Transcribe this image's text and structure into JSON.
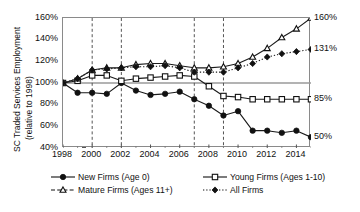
{
  "chart_data": {
    "type": "line",
    "title": "",
    "xlabel": "",
    "ylabel": "SC Traded Services Employment (relative to 1998)",
    "ylabel_line1": "SC Traded Services Employment",
    "ylabel_line2": "(relative to 1998)",
    "x": [
      1998,
      1999,
      2000,
      2001,
      2002,
      2003,
      2004,
      2005,
      2006,
      2007,
      2008,
      2009,
      2010,
      2011,
      2012,
      2013,
      2014,
      2015
    ],
    "xlim": [
      1998,
      2015
    ],
    "ylim": [
      40,
      160
    ],
    "yticks": [
      40,
      60,
      80,
      100,
      120,
      140,
      160
    ],
    "ytick_labels": [
      "40%",
      "60%",
      "80%",
      "100%",
      "120%",
      "140%",
      "160%"
    ],
    "xticks": [
      1998,
      2000,
      2002,
      2004,
      2006,
      2008,
      2010,
      2012,
      2014
    ],
    "xtick_labels": [
      "1998",
      "2000",
      "2002",
      "2004",
      "2006",
      "2008",
      "2010",
      "2012",
      "2014"
    ],
    "xtick_minor": [
      1999,
      2001,
      2003,
      2005,
      2007,
      2009,
      2011,
      2013,
      2015
    ],
    "grid": false,
    "reference_line": 100,
    "recession_lines": [
      2000,
      2002,
      2007,
      2009
    ],
    "legend_position": "below",
    "series": [
      {
        "name": "New Firms (Age 0)",
        "marker": "filled-circle",
        "line_style": "solid",
        "color": "#1a1a1a",
        "values": [
          100,
          91,
          91,
          90,
          100,
          93,
          89,
          90,
          92,
          85,
          79,
          70,
          74,
          56,
          56,
          54,
          56,
          50
        ],
        "end_label": "50%"
      },
      {
        "name": "Young Firms (Ages 1-10)",
        "marker": "open-square",
        "line_style": "solid",
        "color": "#1a1a1a",
        "values": [
          100,
          102,
          107,
          107,
          102,
          104,
          105,
          106,
          107,
          106,
          97,
          88,
          87,
          85,
          85,
          85,
          85,
          85
        ],
        "end_label": "85%"
      },
      {
        "name": "Mature Firms (Ages 11+)",
        "marker": "open-triangle",
        "line_style": "solid",
        "color": "#1a1a1a",
        "values": [
          100,
          104,
          112,
          114,
          114,
          117,
          118,
          118,
          116,
          114,
          114,
          115,
          118,
          124,
          132,
          142,
          150,
          160
        ],
        "end_label": "160%"
      },
      {
        "name": "All Firms",
        "marker": "filled-diamond",
        "line_style": "dotted",
        "color": "#1a1a1a",
        "values": [
          100,
          104,
          112,
          113,
          114,
          115,
          115,
          116,
          114,
          110,
          110,
          110,
          114,
          118,
          124,
          127,
          129,
          131
        ],
        "end_label": "131%"
      }
    ],
    "end_labels": [
      {
        "text": "160%",
        "value": 160
      },
      {
        "text": "131%",
        "value": 131
      },
      {
        "text": "85%",
        "value": 85
      },
      {
        "text": "50%",
        "value": 50
      }
    ]
  },
  "legend": {
    "items": [
      {
        "label": "New Firms (Age 0)",
        "marker": "filled-circle",
        "style": "solid"
      },
      {
        "label": "Young Firms (Ages 1-10)",
        "marker": "open-square",
        "style": "solid"
      },
      {
        "label": "Mature Firms (Ages 11+)",
        "marker": "open-triangle",
        "style": "dashed"
      },
      {
        "label": "All Firms",
        "marker": "filled-diamond",
        "style": "dotted"
      }
    ]
  },
  "colors": {
    "axis": "#8a8a8a",
    "line": "#1a1a1a",
    "reference": "#9a9a9a",
    "recession": "#555555",
    "text": "#111111",
    "background": "#ffffff"
  }
}
